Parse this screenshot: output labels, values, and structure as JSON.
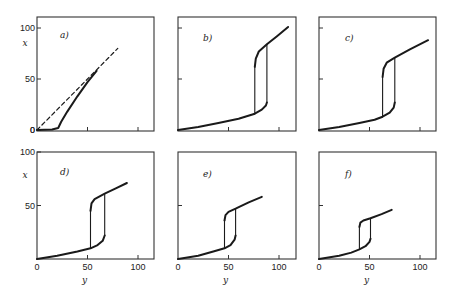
{
  "chart_data": [
    {
      "type": "line",
      "panel": "a)",
      "xlabel": "",
      "ylabel": "x",
      "yticks": [
        "0",
        "50",
        "100"
      ],
      "xticks": [],
      "xlim": [
        0,
        115
      ],
      "ylim": [
        0,
        110
      ],
      "series": [
        {
          "name": "solid",
          "style": "solid",
          "points": [
            [
              0,
              0
            ],
            [
              15,
              0.5
            ],
            [
              21,
              2
            ],
            [
              24,
              8
            ],
            [
              30,
              18
            ],
            [
              40,
              33
            ],
            [
              50,
              47
            ],
            [
              59,
              58
            ]
          ]
        },
        {
          "name": "dashed",
          "style": "dashed",
          "points": [
            [
              0,
              0
            ],
            [
              80,
              80
            ]
          ]
        }
      ]
    },
    {
      "type": "line",
      "panel": "b)",
      "xlabel": "",
      "ylabel": "",
      "xlim": [
        0,
        115
      ],
      "ylim": [
        0,
        110
      ],
      "series": [
        {
          "name": "lower branch",
          "style": "solid",
          "points": [
            [
              0,
              0
            ],
            [
              20,
              3
            ],
            [
              40,
              7
            ],
            [
              60,
              11
            ],
            [
              76,
              16
            ],
            [
              83,
              20
            ],
            [
              87,
              24
            ],
            [
              88,
              27
            ]
          ]
        },
        {
          "name": "upper branch",
          "style": "solid",
          "points": [
            [
              76,
              62
            ],
            [
              77,
              70
            ],
            [
              80,
              77
            ],
            [
              88,
              84
            ],
            [
              98,
              92
            ],
            [
              109,
              101
            ]
          ]
        },
        {
          "name": "jump left",
          "style": "solid",
          "points": [
            [
              76,
              16
            ],
            [
              76,
              62
            ]
          ]
        },
        {
          "name": "jump right",
          "style": "solid",
          "points": [
            [
              88,
              27
            ],
            [
              88,
              84
            ]
          ]
        }
      ]
    },
    {
      "type": "line",
      "panel": "c)",
      "xlim": [
        0,
        115
      ],
      "ylim": [
        0,
        110
      ],
      "series": [
        {
          "name": "lower branch",
          "style": "solid",
          "points": [
            [
              0,
              0
            ],
            [
              20,
              3
            ],
            [
              40,
              7
            ],
            [
              55,
              10
            ],
            [
              63,
              13
            ],
            [
              70,
              17
            ],
            [
              74,
              22
            ],
            [
              75,
              27
            ]
          ]
        },
        {
          "name": "upper branch",
          "style": "solid",
          "points": [
            [
              63,
              52
            ],
            [
              64,
              60
            ],
            [
              67,
              66
            ],
            [
              75,
              71
            ],
            [
              90,
              79
            ],
            [
              108,
              88
            ]
          ]
        },
        {
          "name": "jump left",
          "style": "solid",
          "points": [
            [
              63,
              13
            ],
            [
              63,
              52
            ]
          ]
        },
        {
          "name": "jump right",
          "style": "solid",
          "points": [
            [
              75,
              27
            ],
            [
              75,
              71
            ]
          ]
        }
      ]
    },
    {
      "type": "line",
      "panel": "d)",
      "xlabel": "y",
      "ylabel": "x",
      "xticks": [
        "0",
        "50",
        "100"
      ],
      "yticks": [
        "50",
        "100"
      ],
      "xlim": [
        0,
        115
      ],
      "ylim": [
        0,
        100
      ],
      "series": [
        {
          "name": "lower branch",
          "style": "solid",
          "points": [
            [
              0,
              0
            ],
            [
              20,
              3
            ],
            [
              40,
              7
            ],
            [
              53,
              10
            ],
            [
              60,
              13
            ],
            [
              65,
              17
            ],
            [
              67,
              22
            ]
          ]
        },
        {
          "name": "upper branch",
          "style": "solid",
          "points": [
            [
              53,
              45
            ],
            [
              54,
              52
            ],
            [
              57,
              56
            ],
            [
              67,
              61
            ],
            [
              78,
              66
            ],
            [
              89,
              71
            ]
          ]
        },
        {
          "name": "jump left",
          "style": "solid",
          "points": [
            [
              53,
              10
            ],
            [
              53,
              45
            ]
          ]
        },
        {
          "name": "jump right",
          "style": "solid",
          "points": [
            [
              67,
              22
            ],
            [
              67,
              61
            ]
          ]
        }
      ]
    },
    {
      "type": "line",
      "panel": "e)",
      "xlabel": "y",
      "xticks": [
        "0",
        "50",
        "100"
      ],
      "xlim": [
        0,
        115
      ],
      "ylim": [
        0,
        100
      ],
      "series": [
        {
          "name": "lower branch",
          "style": "solid",
          "points": [
            [
              0,
              0
            ],
            [
              20,
              3
            ],
            [
              35,
              7
            ],
            [
              46,
              10
            ],
            [
              52,
              13
            ],
            [
              56,
              18
            ],
            [
              57,
              22
            ]
          ]
        },
        {
          "name": "upper branch",
          "style": "solid",
          "points": [
            [
              46,
              36
            ],
            [
              47,
              41
            ],
            [
              50,
              44
            ],
            [
              57,
              47
            ],
            [
              70,
              53
            ],
            [
              83,
              58
            ]
          ]
        },
        {
          "name": "jump left",
          "style": "solid",
          "points": [
            [
              46,
              10
            ],
            [
              46,
              36
            ]
          ]
        },
        {
          "name": "jump right",
          "style": "solid",
          "points": [
            [
              57,
              22
            ],
            [
              57,
              47
            ]
          ]
        }
      ]
    },
    {
      "type": "line",
      "panel": "f)",
      "xlabel": "y",
      "xticks": [
        "0",
        "50",
        "100"
      ],
      "xlim": [
        0,
        115
      ],
      "ylim": [
        0,
        100
      ],
      "series": [
        {
          "name": "lower branch",
          "style": "solid",
          "points": [
            [
              0,
              0
            ],
            [
              20,
              3
            ],
            [
              32,
              6
            ],
            [
              40,
              9
            ],
            [
              46,
              12
            ],
            [
              50,
              16
            ],
            [
              51,
              19
            ]
          ]
        },
        {
          "name": "upper branch",
          "style": "solid",
          "points": [
            [
              40,
              30
            ],
            [
              41,
              34
            ],
            [
              44,
              36
            ],
            [
              51,
              38
            ],
            [
              62,
              42
            ],
            [
              72,
              46
            ]
          ]
        },
        {
          "name": "jump left",
          "style": "solid",
          "points": [
            [
              40,
              9
            ],
            [
              40,
              30
            ]
          ]
        },
        {
          "name": "jump right",
          "style": "solid",
          "points": [
            [
              51,
              19
            ],
            [
              51,
              38
            ]
          ]
        }
      ]
    }
  ],
  "layout": {
    "panels": [
      {
        "left": 37,
        "top": 17,
        "right": 154,
        "bottom": 131,
        "y0": 130,
        "y100": 28,
        "x0": 37,
        "x100": 138,
        "tickY": [
          0,
          50,
          100
        ],
        "tickLabelsY": true,
        "tickX": [
          50,
          100
        ],
        "tickLabelsX": false,
        "ylabelShown": true,
        "xlabelShown": false,
        "labelPos": [
          60,
          38
        ]
      },
      {
        "left": 178,
        "top": 17,
        "right": 296,
        "bottom": 131,
        "y0": 130,
        "y100": 28,
        "x0": 178,
        "x100": 279,
        "tickY": [
          50,
          100
        ],
        "tickLabelsY": false,
        "tickX": [
          50,
          100
        ],
        "tickLabelsX": false,
        "ylabelShown": false,
        "xlabelShown": false,
        "labelPos": [
          203,
          41
        ]
      },
      {
        "left": 319,
        "top": 17,
        "right": 436,
        "bottom": 131,
        "y0": 130,
        "y100": 28,
        "x0": 319,
        "x100": 420,
        "tickY": [
          50,
          100
        ],
        "tickLabelsY": false,
        "tickX": [
          50,
          100
        ],
        "tickLabelsX": false,
        "ylabelShown": false,
        "xlabelShown": false,
        "labelPos": [
          345,
          41
        ]
      },
      {
        "left": 37,
        "top": 152,
        "right": 154,
        "bottom": 259,
        "y0": 259,
        "y100": 152,
        "x0": 37,
        "x100": 138,
        "tickY": [
          50,
          100
        ],
        "tickLabelsY": true,
        "tickX": [
          50,
          100
        ],
        "tickLabelsX": true,
        "ylabelShown": true,
        "xlabelShown": true,
        "labelPos": [
          60,
          175
        ]
      },
      {
        "left": 178,
        "top": 152,
        "right": 296,
        "bottom": 259,
        "y0": 259,
        "y100": 152,
        "x0": 178,
        "x100": 279,
        "tickY": [
          50
        ],
        "tickLabelsY": false,
        "tickX": [
          50,
          100
        ],
        "tickLabelsX": true,
        "ylabelShown": false,
        "xlabelShown": true,
        "labelPos": [
          203,
          177
        ]
      },
      {
        "left": 319,
        "top": 152,
        "right": 436,
        "bottom": 259,
        "y0": 259,
        "y100": 152,
        "x0": 319,
        "x100": 420,
        "tickY": [
          50
        ],
        "tickLabelsY": false,
        "tickX": [
          50,
          100
        ],
        "tickLabelsX": true,
        "ylabelShown": false,
        "xlabelShown": true,
        "labelPos": [
          345,
          177
        ]
      }
    ]
  },
  "colors": {
    "line": "#1a1a1a",
    "frame": "#333333",
    "background": "#ffffff"
  }
}
